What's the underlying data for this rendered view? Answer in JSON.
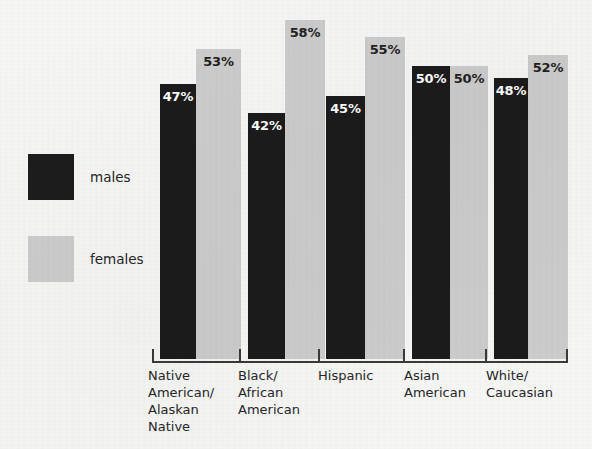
{
  "chart_data": {
    "type": "bar",
    "title": "",
    "subtitle": "",
    "xlabel": "",
    "ylabel": "",
    "ylim": [
      0,
      60
    ],
    "grid": false,
    "legend_position": "left",
    "orientation": "vertical",
    "grouped": true,
    "value_suffix": "%",
    "categories": [
      "Native\nAmerican/\nAlaskan\nNative",
      "Black/\nAfrican\nAmerican",
      "Hispanic",
      "Asian\nAmerican",
      "White/\nCaucasian"
    ],
    "series": [
      {
        "name": "males",
        "color": "#1b1b1b",
        "values": [
          47,
          42,
          45,
          50,
          48
        ],
        "labels": [
          "47%",
          "42%",
          "45%",
          "50%",
          "48%"
        ]
      },
      {
        "name": "females",
        "color": "#cdcdcd",
        "values": [
          53,
          58,
          55,
          50,
          52
        ],
        "labels": [
          "53%",
          "58%",
          "55%",
          "50%",
          "52%"
        ]
      }
    ],
    "annotations": []
  },
  "legend": {
    "items": [
      {
        "label": "males",
        "swatch": "dark-swatch-icon",
        "color": "#1b1b1b"
      },
      {
        "label": "females",
        "swatch": "light-swatch-icon",
        "color": "#cdcdcd"
      }
    ]
  },
  "axis": {
    "baseline_color": "#3a3a3a",
    "tick_count": 6
  },
  "canvas": {
    "background": "#f7f7f6",
    "width": 592,
    "height": 449
  }
}
